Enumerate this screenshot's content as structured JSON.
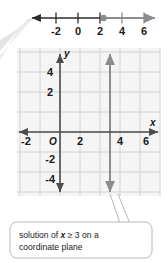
{
  "figure": {
    "title_hidden": "",
    "number_line": {
      "name": "number-line",
      "ticks": [
        "-2",
        "0",
        "2",
        "4",
        "6"
      ],
      "tick_values": [
        -2,
        0,
        2,
        4,
        6
      ],
      "min": -3.6,
      "max": 7.6,
      "point": {
        "value": 3,
        "label": "3",
        "closed": true,
        "color": "#8c8c8c"
      },
      "ray_direction": "right",
      "ray_color": "#8c8c8c",
      "line_color": "#2b2b2b"
    },
    "coordinate_plane": {
      "name": "coordinate-plane",
      "grid": true,
      "grid_color": "#cfcfcf",
      "grid_bg": "#f4f4f4",
      "axis_color": "#4d4d4d",
      "x_label": "x",
      "y_label": "y",
      "origin_label": "O",
      "x_ticks": [
        "-2",
        "2",
        "4",
        "6"
      ],
      "x_tick_values": [
        -2,
        2,
        4,
        6
      ],
      "y_ticks": [
        "4",
        "2",
        "-2",
        "-4"
      ],
      "y_tick_values": [
        4,
        2,
        -2,
        -4
      ],
      "xlim": [
        -3.2,
        7.3
      ],
      "ylim": [
        -5.1,
        5.2
      ],
      "solution_line": {
        "name": "solution-line",
        "equation": "x = 3",
        "x_value": 3,
        "color": "#8c8c8c",
        "arrows": "both"
      }
    },
    "callout": {
      "name": "callout-label",
      "text_line1_part1": "solution of ",
      "text_line1_italic": "x",
      "text_line1_part2": " ≥ 3 on a",
      "text_line2": "coordinate plane",
      "full_text": "solution of x ≥ 3 on a coordinate plane",
      "border_color": "#b8b8b8",
      "background": "#ffffff"
    },
    "corner_pointer": {
      "name": "corner-pointer",
      "color": "#e0e0e0"
    }
  }
}
